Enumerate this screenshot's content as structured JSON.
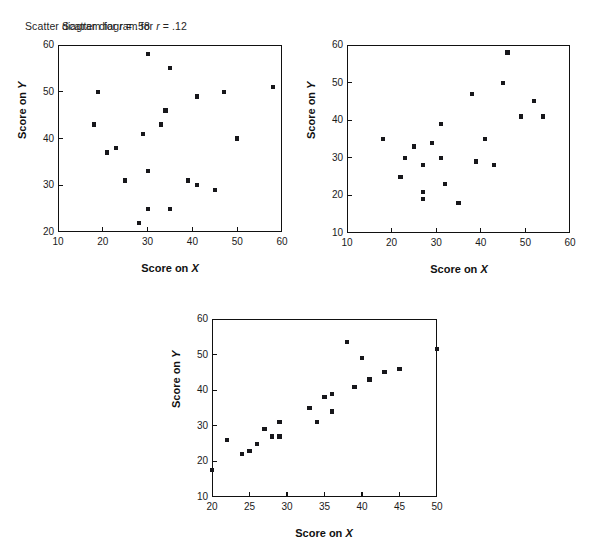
{
  "figure": {
    "background": "#ffffff",
    "marker_color": "#17171b",
    "axis_color": "#111111"
  },
  "panels": [
    {
      "id": "panel-r12",
      "title_prefix": "Scatter diagram for ",
      "title_var": "r",
      "title_suffix": " = .12",
      "chart_data": {
        "type": "scatter",
        "title": "Scatter diagram for r = .12",
        "xlabel": "Score on X",
        "ylabel": "Score on Y",
        "xlim": [
          10,
          60
        ],
        "ylim": [
          20,
          60
        ],
        "xticks": [
          10,
          20,
          30,
          40,
          50,
          60
        ],
        "yticks": [
          20,
          30,
          40,
          50,
          60
        ],
        "grid": false,
        "legend": "none",
        "r": 0.12,
        "points": [
          [
            18,
            43
          ],
          [
            19,
            50
          ],
          [
            21,
            37
          ],
          [
            23,
            38
          ],
          [
            25,
            31
          ],
          [
            28,
            22
          ],
          [
            29,
            41
          ],
          [
            30,
            58
          ],
          [
            30,
            33
          ],
          [
            30,
            25
          ],
          [
            33,
            43
          ],
          [
            34,
            46
          ],
          [
            35,
            55
          ],
          [
            35,
            25
          ],
          [
            39,
            31
          ],
          [
            41,
            49
          ],
          [
            41,
            30
          ],
          [
            45,
            29
          ],
          [
            47,
            50
          ],
          [
            50,
            40
          ],
          [
            58,
            51
          ]
        ]
      }
    },
    {
      "id": "panel-r58",
      "title_prefix": "Scatter diagram for ",
      "title_var": "r",
      "title_suffix": " = .58",
      "chart_data": {
        "type": "scatter",
        "title": "Scatter diagram for r = .58",
        "xlabel": "Score on X",
        "ylabel": "Score on Y",
        "xlim": [
          10,
          60
        ],
        "ylim": [
          10,
          60
        ],
        "xticks": [
          10,
          20,
          30,
          40,
          50,
          60
        ],
        "yticks": [
          10,
          20,
          30,
          40,
          50,
          60
        ],
        "grid": false,
        "legend": "none",
        "r": 0.58,
        "points": [
          [
            18,
            35
          ],
          [
            22,
            25
          ],
          [
            23,
            30
          ],
          [
            25,
            33
          ],
          [
            27,
            28
          ],
          [
            27,
            21
          ],
          [
            27,
            19
          ],
          [
            29,
            34
          ],
          [
            31,
            39
          ],
          [
            31,
            30
          ],
          [
            32,
            23
          ],
          [
            35,
            18
          ],
          [
            38,
            47
          ],
          [
            39,
            29
          ],
          [
            41,
            35
          ],
          [
            43,
            28
          ],
          [
            45,
            50
          ],
          [
            46,
            58
          ],
          [
            49,
            41
          ],
          [
            52,
            45
          ],
          [
            54,
            41
          ]
        ]
      }
    },
    {
      "id": "panel-r92",
      "title_prefix": "Scatter diagram for ",
      "title_var": "r",
      "title_suffix": " = .92",
      "chart_data": {
        "type": "scatter",
        "title": "Scatter diagram for r = .92",
        "xlabel": "Score on X",
        "ylabel": "Score on Y",
        "xlim": [
          20,
          50
        ],
        "ylim": [
          10,
          60
        ],
        "xticks": [
          20,
          25,
          30,
          35,
          40,
          45,
          50
        ],
        "yticks": [
          10,
          20,
          30,
          40,
          50,
          60
        ],
        "grid": false,
        "legend": "none",
        "r": 0.92,
        "points": [
          [
            20,
            17.5
          ],
          [
            22,
            26
          ],
          [
            24,
            22
          ],
          [
            25,
            23
          ],
          [
            26,
            25
          ],
          [
            27,
            29
          ],
          [
            28,
            27
          ],
          [
            29,
            27
          ],
          [
            29,
            31
          ],
          [
            33,
            35
          ],
          [
            34,
            31
          ],
          [
            35,
            38
          ],
          [
            36,
            39
          ],
          [
            36,
            34
          ],
          [
            38,
            53.5
          ],
          [
            39,
            41
          ],
          [
            40,
            49
          ],
          [
            41,
            43
          ],
          [
            43,
            45
          ],
          [
            45,
            46
          ],
          [
            50,
            51.5
          ]
        ]
      }
    }
  ]
}
